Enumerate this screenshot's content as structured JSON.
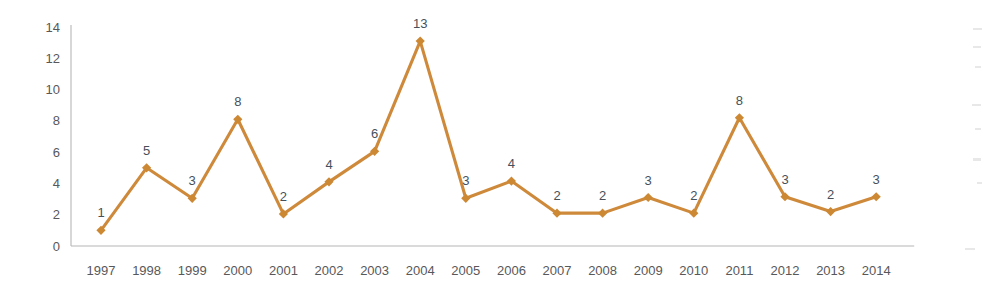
{
  "chart_data": {
    "type": "line",
    "title": "",
    "subtitle": "",
    "xlabel": "",
    "ylabel": "",
    "categories": [
      "1997",
      "1998",
      "1999",
      "2000",
      "2001",
      "2002",
      "2003",
      "2004",
      "2005",
      "2006",
      "2007",
      "2008",
      "2009",
      "2010",
      "2011",
      "2012",
      "2013",
      "2014"
    ],
    "values": [
      1,
      5,
      3,
      8,
      2,
      4,
      6,
      13,
      3,
      4,
      2,
      2,
      3,
      2,
      8,
      3,
      2,
      3
    ],
    "point_labels": [
      "1",
      "5",
      "3",
      "8",
      "2",
      "4",
      "6",
      "13",
      "3",
      "4",
      "2",
      "2",
      "3",
      "2",
      "8",
      "3",
      "2",
      "3"
    ],
    "plotted_values": [
      1.0,
      5.0,
      3.05,
      8.1,
      2.05,
      4.1,
      6.05,
      13.1,
      3.05,
      4.15,
      2.1,
      2.1,
      3.1,
      2.1,
      8.2,
      3.15,
      2.2,
      3.15
    ],
    "series": [
      {
        "name": "",
        "values": [
          1,
          5,
          3,
          8,
          2,
          4,
          6,
          13,
          3,
          4,
          2,
          2,
          3,
          2,
          8,
          3,
          2,
          3
        ]
      }
    ],
    "ylim": [
      0,
      14
    ],
    "ytick_values": [
      0,
      2,
      4,
      6,
      8,
      10,
      12,
      14
    ],
    "ytick_labels": [
      "0",
      "2",
      "4",
      "6",
      "8",
      "10",
      "12",
      "14"
    ],
    "grid": false,
    "legend": false,
    "legend_position": "none",
    "marker": "diamond",
    "colors": {
      "series_line": "#ce8a3a",
      "marker_fill": "#cd8833",
      "axis": "#b6b6b6",
      "tick_text": "#58585a",
      "data_label_text": "#46505a",
      "background": "#ffffff"
    }
  }
}
